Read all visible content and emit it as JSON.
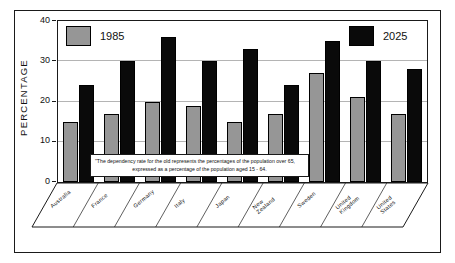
{
  "chart_data": {
    "type": "bar",
    "title": "",
    "xlabel": "",
    "ylabel": "PERCENTAGE",
    "ylim": [
      0,
      40
    ],
    "yticks": [
      0,
      10,
      20,
      30,
      40
    ],
    "grid": true,
    "legend_position": "top",
    "categories": [
      "Australia",
      "France",
      "Germany",
      "Italy",
      "Japan",
      "New Zealand",
      "Sweden",
      "United Kingdom",
      "United States"
    ],
    "series": [
      {
        "name": "1985",
        "color": "#969696",
        "values": [
          15,
          17,
          20,
          19,
          15,
          17,
          27,
          21,
          17
        ]
      },
      {
        "name": "2025",
        "color": "#0a0a0a",
        "values": [
          24,
          30,
          36,
          30,
          33,
          24,
          35,
          30,
          28
        ]
      }
    ],
    "annotations": [
      {
        "name": "footnote",
        "line1": "\"The dependency rate for the old represents the percentages of the population over 65,",
        "line2": "expressed as a percentage of the population aged 15 - 64."
      }
    ]
  },
  "axis": {
    "y_title": "PERCENTAGE",
    "y_tick_labels": [
      "40",
      "30",
      "20",
      "10",
      "0"
    ]
  },
  "legend": {
    "entries": [
      {
        "label": "1985",
        "swatch": "gray-swatch"
      },
      {
        "label": "2025",
        "swatch": "black-swatch"
      }
    ]
  },
  "category_labels": [
    {
      "line1": "Australia",
      "line2": ""
    },
    {
      "line1": "France",
      "line2": ""
    },
    {
      "line1": "Germany",
      "line2": ""
    },
    {
      "line1": "Italy",
      "line2": ""
    },
    {
      "line1": "Japan",
      "line2": ""
    },
    {
      "line1": "New",
      "line2": "Zealand"
    },
    {
      "line1": "Sweden",
      "line2": ""
    },
    {
      "line1": "United",
      "line2": "Kingdom"
    },
    {
      "line1": "United",
      "line2": "States"
    }
  ],
  "footnote": {
    "line1": "\"The dependency rate for the old represents the percentages of the population over 65,",
    "line2": "expressed as a percentage of the population aged 15 - 64."
  }
}
